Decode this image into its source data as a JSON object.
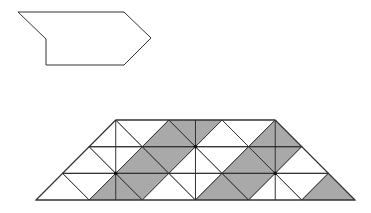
{
  "colors": {
    "background": "#ffffff",
    "stroke": "#333333",
    "shade": "#a9a9a9",
    "dot": "#111111"
  },
  "shape": {
    "name": "pentagon-arrow-outline",
    "points": [
      [
        18,
        12
      ],
      [
        124,
        12
      ],
      [
        151,
        38
      ],
      [
        124,
        65
      ],
      [
        46,
        65
      ],
      [
        46,
        39
      ]
    ]
  },
  "grid": {
    "origin_x": 36,
    "origin_y": 200,
    "unit_x": 26.58,
    "unit_y": 26.67,
    "outline_uv": [
      [
        0,
        0
      ],
      [
        12,
        0
      ],
      [
        9,
        3
      ],
      [
        3,
        3
      ]
    ],
    "horizontal_lines_v": [
      1,
      2
    ],
    "vertical_lines_u": [
      3,
      6,
      9
    ],
    "dots_uv": [
      [
        3,
        1
      ],
      [
        6,
        2
      ],
      [
        9,
        1
      ]
    ],
    "triangles": [
      {
        "row": 0,
        "dir": "up",
        "u0": 0,
        "shaded": false
      },
      {
        "row": 0,
        "dir": "down",
        "u0": 1,
        "shaded": false
      },
      {
        "row": 0,
        "dir": "up",
        "u0": 2,
        "shaded": true
      },
      {
        "row": 0,
        "dir": "down",
        "u0": 3,
        "shaded": true
      },
      {
        "row": 0,
        "dir": "up",
        "u0": 4,
        "shaded": false
      },
      {
        "row": 0,
        "dir": "down",
        "u0": 5,
        "shaded": false
      },
      {
        "row": 0,
        "dir": "up",
        "u0": 6,
        "shaded": true
      },
      {
        "row": 0,
        "dir": "down",
        "u0": 7,
        "shaded": true
      },
      {
        "row": 0,
        "dir": "up",
        "u0": 8,
        "shaded": false
      },
      {
        "row": 0,
        "dir": "down",
        "u0": 9,
        "shaded": false
      },
      {
        "row": 0,
        "dir": "up",
        "u0": 10,
        "shaded": true
      },
      {
        "row": 1,
        "dir": "up",
        "u0": 1,
        "shaded": false
      },
      {
        "row": 1,
        "dir": "down",
        "u0": 2,
        "shaded": false
      },
      {
        "row": 1,
        "dir": "up",
        "u0": 3,
        "shaded": true
      },
      {
        "row": 1,
        "dir": "down",
        "u0": 4,
        "shaded": true
      },
      {
        "row": 1,
        "dir": "up",
        "u0": 5,
        "shaded": false
      },
      {
        "row": 1,
        "dir": "down",
        "u0": 6,
        "shaded": false
      },
      {
        "row": 1,
        "dir": "up",
        "u0": 7,
        "shaded": true
      },
      {
        "row": 1,
        "dir": "down",
        "u0": 8,
        "shaded": true
      },
      {
        "row": 1,
        "dir": "up",
        "u0": 9,
        "shaded": false
      },
      {
        "row": 2,
        "dir": "up",
        "u0": 2,
        "shaded": false
      },
      {
        "row": 2,
        "dir": "down",
        "u0": 3,
        "shaded": false
      },
      {
        "row": 2,
        "dir": "up",
        "u0": 4,
        "shaded": true
      },
      {
        "row": 2,
        "dir": "down",
        "u0": 5,
        "shaded": true
      },
      {
        "row": 2,
        "dir": "up",
        "u0": 6,
        "shaded": false
      },
      {
        "row": 2,
        "dir": "down",
        "u0": 7,
        "shaded": false
      },
      {
        "row": 2,
        "dir": "up",
        "u0": 8,
        "shaded": true
      }
    ]
  }
}
